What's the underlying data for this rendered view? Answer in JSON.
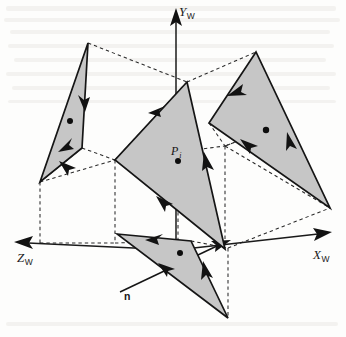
{
  "figure": {
    "background_color": "#fdfdfc",
    "polygon_fill_color": "#c6c6c6",
    "line_color": "#151515",
    "dashed_color": "#2a2a2a"
  },
  "axes": {
    "y": {
      "label": "Y",
      "subscript": "W",
      "name": "y-axis-world",
      "direction": "up"
    },
    "x": {
      "label": "X",
      "subscript": "W",
      "name": "x-axis-world",
      "direction": "right-down"
    },
    "z": {
      "label": "Z",
      "subscript": "W",
      "name": "z-axis-world",
      "direction": "left-down"
    }
  },
  "points": {
    "pi": {
      "label": "P",
      "subscript": "i",
      "name": "point-p-i"
    }
  },
  "vectors": {
    "normal": {
      "label": "n",
      "name": "normal-vector-n"
    }
  },
  "polygons": [
    {
      "name": "polygon-left",
      "vertices": "88,43 40,182 82,148",
      "centroid_dot": [
        70,
        121
      ]
    },
    {
      "name": "polygon-center",
      "vertices": "187,82 115,160 225,249",
      "centroid_dot": [
        178,
        161
      ]
    },
    {
      "name": "polygon-right",
      "vertices": "256,52 209,123 330,208",
      "centroid_dot": [
        266,
        130
      ]
    },
    {
      "name": "polygon-front",
      "vertices": "117,234 191,241 228,318",
      "centroid_dot": [
        180,
        253
      ]
    }
  ],
  "direction_arrows_count": 12,
  "bounding_box": {
    "name": "reference-parallelepiped",
    "style": "dashed"
  }
}
